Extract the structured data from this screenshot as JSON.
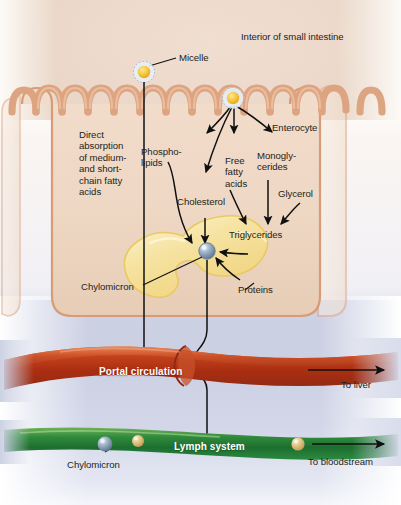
{
  "figure": {
    "lumen_label": "Interior of small intestine"
  },
  "labels": {
    "micelle": "Micelle",
    "enterocyte": "Enterocyte",
    "direct_absorption": "Direct\nabsorption\nof medium-\nand short-\nchain fatty\nacids",
    "phospholipids": "Phospho-\nlipids",
    "free_fatty_acids": "Free\nfatty\nacids",
    "monoglycerides": "Monogly-\ncerides",
    "glycerol": "Glycerol",
    "cholesterol": "Cholesterol",
    "triglycerides": "Triglycerides",
    "proteins": "Proteins",
    "chylomicron_cell": "Chylomicron",
    "portal_circulation": "Portal circulation",
    "lymph_system": "Lymph system",
    "chylomicron_lymph": "Chylomicron",
    "to_liver": "To liver",
    "to_bloodstream": "To bloodstream"
  },
  "colors": {
    "lumen_bg": "#ecd9cb",
    "lower_bg": "#ccd1e4",
    "cell_fill": "#f0d9c6",
    "cell_border": "#d79b76",
    "villi": "#dda482",
    "lipid_droplet": "#f4e09a",
    "lipid_droplet_edge": "#e8c964",
    "micelle_core": "#f6c63f",
    "micelle_ring": "#b9c8dd",
    "portal_vessel": "#b8381a",
    "portal_vessel_light": "#e07a49",
    "lymph_vessel": "#1f7a36",
    "lymph_vessel_light": "#6fae56",
    "chylomicron_blue": "#93a8bd",
    "chylomicron_tan": "#e3c387",
    "arrow": "#101010",
    "text": "#231f20",
    "text_on_vessel": "#ffffff"
  },
  "icons": {
    "micelle": "micelle-icon",
    "chylomicron": "chylomicron-icon",
    "arrow": "arrow-icon",
    "lipid_droplet": "lipid-droplet-icon"
  }
}
